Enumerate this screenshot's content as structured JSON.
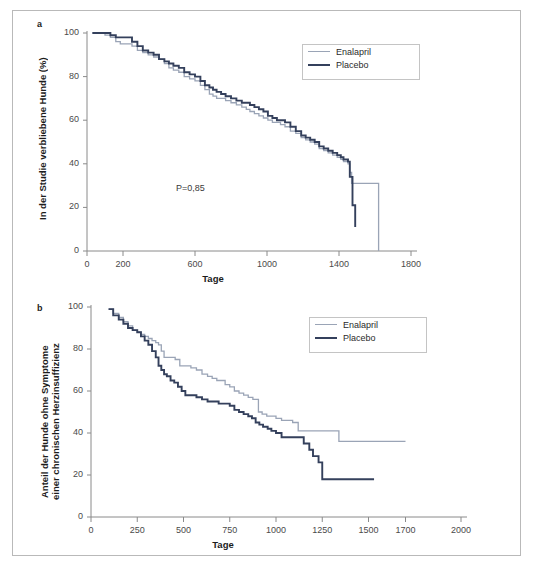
{
  "figure": {
    "panels": [
      {
        "letter": "a",
        "ylabel": "In der Studie verbliebene Hunde (%)",
        "xlabel": "Tage",
        "annotation": "P=0,85"
      },
      {
        "letter": "b",
        "ylabel_line1": "Anteil der Hunde ohne Symptome",
        "ylabel_line2": "einer chronischen Herzinsuffizienz",
        "xlabel": "Tage"
      }
    ],
    "colors": {
      "enalapril": "#9aa4b6",
      "placebo": "#34405c",
      "axis": "#8a8a8a",
      "text": "#2b2b2b",
      "frame": "#b9b9b9"
    }
  },
  "chart_data": [
    {
      "type": "line",
      "panel": "a",
      "title": "",
      "xlabel": "Tage",
      "ylabel": "In der Studie verbliebene Hunde (%)",
      "xlim": [
        0,
        1800
      ],
      "ylim": [
        0,
        100
      ],
      "xticks": [
        0,
        200,
        600,
        1000,
        1400,
        1800
      ],
      "xtick_labels": [
        "0",
        "200",
        "600",
        "1000",
        "1400",
        "1800"
      ],
      "yticks": [
        0,
        20,
        40,
        60,
        80,
        100
      ],
      "ytick_labels": [
        "0",
        "20",
        "40",
        "60",
        "80",
        "100"
      ],
      "grid": false,
      "legend_position": "top-right",
      "annotations": [
        {
          "text": "P=0,85",
          "x": 560,
          "y": 30
        }
      ],
      "step": "post",
      "series": [
        {
          "name": "Enalapril",
          "color": "#9aa4b6",
          "x": [
            30,
            60,
            100,
            130,
            160,
            185,
            210,
            240,
            250,
            280,
            310,
            340,
            370,
            400,
            430,
            455,
            480,
            510,
            540,
            570,
            600,
            630,
            655,
            680,
            700,
            720,
            745,
            770,
            800,
            830,
            860,
            885,
            905,
            930,
            955,
            980,
            1005,
            1030,
            1055,
            1075,
            1100,
            1130,
            1160,
            1190,
            1215,
            1240,
            1265,
            1290,
            1315,
            1340,
            1365,
            1390,
            1410,
            1425,
            1440,
            1450,
            1460,
            1470,
            1620,
            1620
          ],
          "values": [
            100,
            100,
            99,
            98,
            96,
            95,
            95,
            95,
            94,
            92,
            91,
            90,
            89,
            88,
            86,
            84,
            83,
            82,
            80,
            79,
            78,
            76,
            74,
            72,
            71,
            70,
            70,
            69,
            68,
            67,
            66,
            65,
            64,
            63,
            62,
            61,
            60,
            59,
            59,
            58,
            57,
            55,
            54,
            52,
            51,
            50,
            49,
            47,
            46,
            45,
            44,
            43,
            42,
            41,
            41,
            40,
            36,
            31,
            31,
            0
          ]
        },
        {
          "name": "Placebo",
          "color": "#34405c",
          "x": [
            30,
            60,
            100,
            130,
            160,
            185,
            210,
            240,
            250,
            280,
            310,
            340,
            370,
            400,
            430,
            455,
            480,
            510,
            540,
            570,
            600,
            630,
            655,
            680,
            700,
            720,
            745,
            770,
            800,
            830,
            860,
            885,
            905,
            930,
            955,
            980,
            1005,
            1030,
            1055,
            1075,
            1100,
            1130,
            1160,
            1190,
            1215,
            1240,
            1265,
            1290,
            1315,
            1340,
            1365,
            1390,
            1410,
            1425,
            1440,
            1450,
            1460,
            1475,
            1490
          ],
          "values": [
            100,
            100,
            100,
            99,
            98,
            98,
            98,
            98,
            96,
            94,
            92,
            91,
            90,
            88,
            87,
            86,
            85,
            84,
            82,
            81,
            80,
            78,
            76,
            75,
            74,
            73,
            72,
            71,
            70,
            69,
            68,
            68,
            67,
            66,
            65,
            64,
            62,
            61,
            60,
            60,
            59,
            57,
            55,
            53,
            52,
            51,
            50,
            48,
            47,
            46,
            45,
            44,
            43,
            42,
            42,
            41,
            34,
            21,
            11
          ]
        }
      ]
    },
    {
      "type": "line",
      "panel": "b",
      "title": "",
      "xlabel": "Tage",
      "ylabel": "Anteil der Hunde ohne Symptome einer chronischen Herzinsuffizienz",
      "xlim": [
        0,
        2000
      ],
      "ylim": [
        0,
        100
      ],
      "xticks": [
        0,
        250,
        500,
        750,
        1000,
        1250,
        1500,
        1700,
        2000
      ],
      "xtick_labels": [
        "0",
        "250",
        "500",
        "750",
        "1000",
        "1250",
        "1500",
        "1700",
        "2000"
      ],
      "yticks": [
        0,
        20,
        40,
        60,
        80,
        100
      ],
      "ytick_labels": [
        "0",
        "20",
        "40",
        "60",
        "80",
        "100"
      ],
      "grid": false,
      "legend_position": "top-right",
      "step": "post",
      "series": [
        {
          "name": "Enalapril",
          "color": "#9aa4b6",
          "x": [
            95,
            120,
            150,
            175,
            200,
            225,
            250,
            270,
            290,
            310,
            330,
            350,
            365,
            380,
            395,
            410,
            430,
            455,
            480,
            510,
            540,
            570,
            600,
            630,
            655,
            680,
            700,
            725,
            750,
            775,
            800,
            825,
            850,
            875,
            890,
            905,
            925,
            950,
            975,
            1000,
            1030,
            1060,
            1090,
            1120,
            1150,
            1200,
            1250,
            1300,
            1340,
            1700
          ],
          "values": [
            99,
            97,
            95,
            93,
            91,
            89,
            88,
            87,
            86,
            85,
            84,
            83,
            82,
            79,
            76,
            76,
            76,
            75,
            72,
            72,
            71,
            70,
            68,
            67,
            66,
            65,
            65,
            63,
            62,
            60,
            59,
            58,
            57,
            56,
            56,
            50,
            49,
            48,
            48,
            47,
            46,
            46,
            45,
            41,
            41,
            41,
            41,
            41,
            36,
            36
          ]
        },
        {
          "name": "Placebo",
          "color": "#34405c",
          "x": [
            95,
            120,
            150,
            175,
            200,
            225,
            250,
            270,
            290,
            310,
            330,
            350,
            365,
            380,
            395,
            410,
            430,
            450,
            470,
            490,
            510,
            540,
            570,
            600,
            630,
            660,
            690,
            720,
            750,
            775,
            800,
            825,
            850,
            870,
            890,
            910,
            930,
            955,
            975,
            1000,
            1030,
            1060,
            1090,
            1120,
            1150,
            1180,
            1200,
            1230,
            1250,
            1530
          ],
          "values": [
            99,
            96,
            94,
            92,
            90,
            89,
            88,
            86,
            84,
            82,
            79,
            76,
            72,
            70,
            68,
            67,
            65,
            64,
            62,
            60,
            58,
            58,
            57,
            56,
            55,
            55,
            54,
            54,
            53,
            51,
            50,
            49,
            48,
            47,
            45,
            44,
            43,
            42,
            41,
            40,
            38,
            38,
            38,
            38,
            35,
            32,
            29,
            26,
            18,
            18
          ]
        }
      ]
    }
  ],
  "legend": {
    "entries": [
      {
        "label": "Enalapril",
        "color": "#9aa4b6"
      },
      {
        "label": "Placebo",
        "color": "#34405c"
      }
    ]
  }
}
